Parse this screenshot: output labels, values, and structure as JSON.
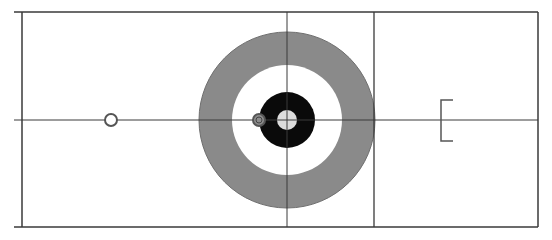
{
  "diagram": {
    "type": "curling-sheet",
    "width": 552,
    "height": 240,
    "colors": {
      "background": "#ffffff",
      "line": "#3a3a3a",
      "twelve_foot_ring": "#8a8a8a",
      "eight_foot_ring": "#ffffff",
      "four_foot_ring": "#0a0a0a",
      "button": "#dcdcdc",
      "stone_outline": "#555555",
      "stone_fill_gray": "#8c8c8c",
      "stone_fill_white": "#ffffff",
      "bracket": "#555555"
    },
    "sheet": {
      "left": 22,
      "top": 12,
      "right": 538,
      "bottom": 227,
      "side_line_start_x": 14
    },
    "center_line": {
      "y": 120,
      "x1": 14,
      "x2": 538
    },
    "tee_line": {
      "x": 287,
      "y1": 12,
      "y2": 227
    },
    "hog_line": {
      "x": 374,
      "y1": 12,
      "y2": 227
    },
    "house": {
      "cx": 287,
      "cy": 120,
      "rings": [
        {
          "name": "twelve-foot",
          "r": 88
        },
        {
          "name": "eight-foot",
          "r": 55
        },
        {
          "name": "four-foot",
          "r": 28
        },
        {
          "name": "button",
          "r": 10
        }
      ]
    },
    "stones": [
      {
        "id": "stone-1",
        "cx": 111,
        "cy": 120,
        "r": 6,
        "fill": "white"
      },
      {
        "id": "stone-2",
        "cx": 259,
        "cy": 120,
        "r": 6,
        "fill": "gray"
      }
    ],
    "hack_bracket": {
      "x": 441,
      "y1": 100,
      "y2": 141,
      "tick_x2": 453
    }
  }
}
